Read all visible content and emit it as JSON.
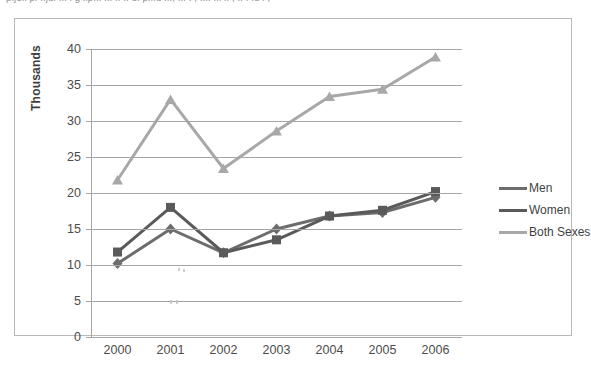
{
  "top_cut_text": "p.ju.i p. ..ju. ... i g .ip... ... .. .. u. p...u ...,  ... . , .... ..i .. , ..  . .u .  ,",
  "axis": {
    "y_title": "Thousands",
    "y_ticks": [
      "0",
      "5",
      "10",
      "15",
      "20",
      "25",
      "30",
      "35",
      "40"
    ],
    "x_ticks": [
      "2000",
      "2001",
      "2002",
      "2003",
      "2004",
      "2005",
      "2006"
    ]
  },
  "legend": {
    "position": "right",
    "entries": [
      {
        "label": "Men",
        "marker": "diamond",
        "color": "#6d6d6d"
      },
      {
        "label": "Women",
        "marker": "square",
        "color": "#5a5a5a"
      },
      {
        "label": "Both Sexes",
        "marker": "triangle",
        "color": "#a8a8a8"
      }
    ]
  },
  "colors": {
    "men": "#6d6d6d",
    "women": "#5a5a5a",
    "both_sexes": "#a8a8a8",
    "gridline": "#a6a6a6",
    "frame": "#b9b9b9",
    "text": "#4b4b4b"
  },
  "chart_data": {
    "type": "line",
    "title": "",
    "xlabel": "",
    "ylabel": "Thousands",
    "categories": [
      "2000",
      "2001",
      "2002",
      "2003",
      "2004",
      "2005",
      "2006"
    ],
    "ylim": [
      0,
      40
    ],
    "ytick_step": 5,
    "grid": true,
    "legend_position": "right",
    "series": [
      {
        "name": "Men",
        "marker": "diamond",
        "color": "#6d6d6d",
        "values": [
          10.2,
          15.0,
          11.7,
          15.0,
          16.8,
          17.3,
          19.4
        ]
      },
      {
        "name": "Women",
        "marker": "square",
        "color": "#5a5a5a",
        "values": [
          11.8,
          18.0,
          11.7,
          13.5,
          16.8,
          17.6,
          20.2
        ]
      },
      {
        "name": "Both Sexes",
        "marker": "triangle",
        "color": "#a8a8a8",
        "values": [
          21.8,
          33.0,
          23.4,
          28.6,
          33.4,
          34.4,
          38.9
        ]
      }
    ]
  }
}
